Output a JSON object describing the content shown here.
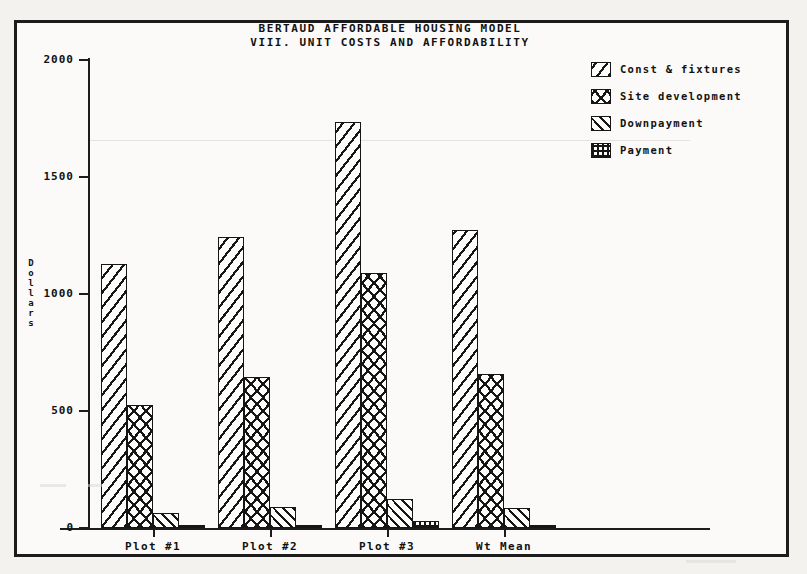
{
  "chart_data": {
    "type": "bar",
    "title": "BERTAUD AFFORDABLE HOUSING MODEL",
    "subtitle": "VIII. UNIT COSTS AND AFFORDABILITY",
    "xlabel": "",
    "ylabel": "Dollars",
    "ylim": [
      0,
      2000
    ],
    "ytick_values": [
      2000,
      1500,
      1000,
      500,
      0
    ],
    "ytick_labels": [
      "2000",
      "1500",
      "1000",
      "500",
      "0"
    ],
    "grid": false,
    "legend_position": "top-right",
    "categories": [
      "Plot #1",
      "Plot #2",
      "Plot #3",
      "Wt Mean"
    ],
    "series": [
      {
        "name": "Const & fixtures",
        "pattern": "diagonal-hatch",
        "values": [
          1130,
          1245,
          1735,
          1275
        ]
      },
      {
        "name": "Site development",
        "pattern": "cross-hatch",
        "values": [
          525,
          645,
          1090,
          660
        ]
      },
      {
        "name": "Downpayment",
        "pattern": "fine-diagonal-hatch",
        "values": [
          65,
          90,
          125,
          85
        ]
      },
      {
        "name": "Payment",
        "pattern": "grid-hatch",
        "values": [
          10,
          12,
          28,
          14
        ]
      }
    ]
  },
  "legend": {
    "items": [
      {
        "label": "Const & fixtures"
      },
      {
        "label": "Site development"
      },
      {
        "label": "Downpayment"
      },
      {
        "label": "Payment"
      }
    ]
  },
  "colors": {
    "ink": "#161616",
    "paper": "#fbfaf8",
    "page": "#f3f2ef"
  }
}
